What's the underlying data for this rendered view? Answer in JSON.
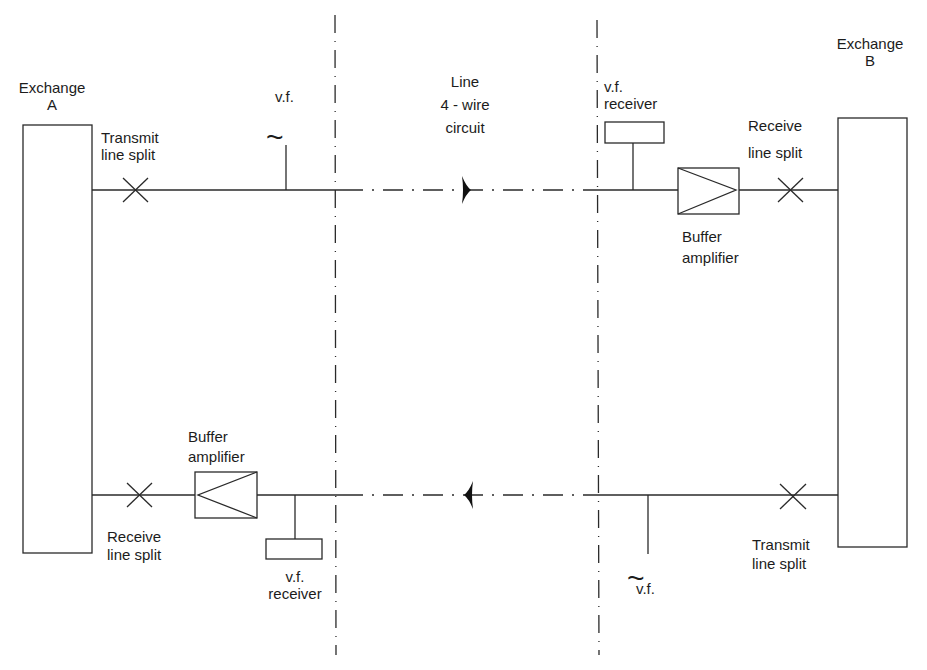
{
  "diagram": {
    "exchange_a": {
      "line1": "Exchange",
      "line2": "A"
    },
    "exchange_b": {
      "line1": "Exchange",
      "line2": "B"
    },
    "line_section": {
      "line1": "Line",
      "line2": "4 - wire",
      "line3": "circuit"
    },
    "top_path": {
      "direction": "A to B",
      "transmit_split": {
        "line1": "Transmit",
        "line2": "line split"
      },
      "vf_source": {
        "label": "v.f.",
        "symbol": "~"
      },
      "vf_receiver": {
        "line1": "v.f.",
        "line2": "receiver"
      },
      "buffer_amplifier": {
        "line1": "Buffer",
        "line2": "amplifier"
      },
      "receive_split": {
        "line1": "Receive",
        "line2": "line split"
      }
    },
    "bottom_path": {
      "direction": "B to A",
      "buffer_amplifier": {
        "line1": "Buffer",
        "line2": "amplifier"
      },
      "receive_split": {
        "line1": "Receive",
        "line2": "line split"
      },
      "vf_receiver": {
        "line1": "v.f.",
        "line2": "receiver"
      },
      "vf_source": {
        "label": "v.f.",
        "symbol": "~"
      },
      "transmit_split": {
        "line1": "Transmit",
        "line2": "line split"
      }
    },
    "colors": {
      "stroke": "#2a2a2a",
      "background": "#ffffff"
    }
  }
}
